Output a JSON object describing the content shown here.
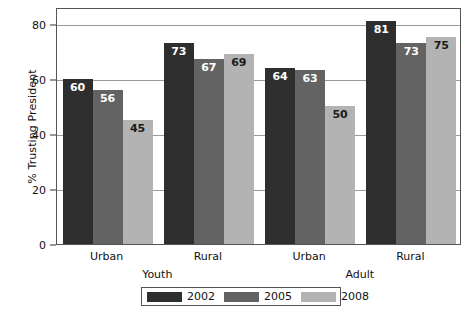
{
  "chart_data": {
    "type": "bar",
    "title": "",
    "subtitle": "",
    "xlabel": "",
    "ylabel": "% Trusting President",
    "ylim": [
      0,
      86
    ],
    "yticks": [
      0,
      20,
      40,
      60,
      80
    ],
    "ytick_labels": [
      "0",
      "20",
      "40",
      "60",
      "80"
    ],
    "grid": true,
    "legend_position": "bottom",
    "categories": [
      "Urban",
      "Rural",
      "Urban",
      "Rural"
    ],
    "supergroups": [
      {
        "label": "Youth",
        "categories": [
          "Urban",
          "Rural"
        ]
      },
      {
        "label": "Adult",
        "categories": [
          "Urban",
          "Rural"
        ]
      }
    ],
    "series": [
      {
        "name": "2002",
        "color": "#2e2e2e",
        "values": [
          60,
          73,
          64,
          81
        ]
      },
      {
        "name": "2005",
        "color": "#636363",
        "values": [
          56,
          67,
          63,
          73
        ]
      },
      {
        "name": "2008",
        "color": "#b3b3b3",
        "values": [
          45,
          69,
          50,
          75
        ]
      }
    ],
    "data_labels": [
      {
        "group": 0,
        "series": "2002",
        "value": "60",
        "text_color": "light"
      },
      {
        "group": 0,
        "series": "2005",
        "value": "56",
        "text_color": "light"
      },
      {
        "group": 0,
        "series": "2008",
        "value": "45",
        "text_color": "dark"
      },
      {
        "group": 1,
        "series": "2002",
        "value": "73",
        "text_color": "light"
      },
      {
        "group": 1,
        "series": "2005",
        "value": "67",
        "text_color": "light"
      },
      {
        "group": 1,
        "series": "2008",
        "value": "69",
        "text_color": "dark"
      },
      {
        "group": 2,
        "series": "2002",
        "value": "64",
        "text_color": "light"
      },
      {
        "group": 2,
        "series": "2005",
        "value": "63",
        "text_color": "light"
      },
      {
        "group": 2,
        "series": "2008",
        "value": "50",
        "text_color": "dark"
      },
      {
        "group": 3,
        "series": "2002",
        "value": "81",
        "text_color": "light"
      },
      {
        "group": 3,
        "series": "2005",
        "value": "73",
        "text_color": "light"
      },
      {
        "group": 3,
        "series": "2008",
        "value": "75",
        "text_color": "dark"
      }
    ],
    "legend": [
      {
        "label": "2002",
        "color": "#2e2e2e"
      },
      {
        "label": "2005",
        "color": "#636363"
      },
      {
        "label": "2008",
        "color": "#b3b3b3"
      }
    ]
  },
  "colors": {
    "series_2002": "#2e2e2e",
    "series_2005": "#636363",
    "series_2008": "#b3b3b3",
    "axis": "#555555",
    "grid": "#9a9a9a",
    "background": "#ffffff",
    "text": "#111111"
  }
}
